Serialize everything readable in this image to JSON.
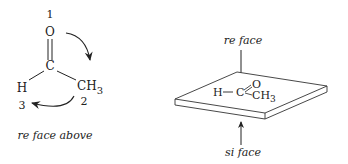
{
  "left_panel": {
    "molecule": {
      "oxygen": "O",
      "carbon": "C",
      "hydrogen": "H",
      "methyl": "CH",
      "methyl_sub": "3"
    },
    "priorities": {
      "oxygen": "1",
      "methyl": "2",
      "hydrogen": "3"
    },
    "caption": "re face above"
  },
  "right_panel": {
    "top_label": "re face",
    "bottom_label": "si face",
    "molecule": {
      "hydrogen": "H",
      "bond": "−",
      "carbon": "C",
      "oxygen": "O",
      "methyl": "CH",
      "methyl_sub": "3"
    }
  },
  "colors": {
    "ink": "#222222",
    "background": "#ffffff"
  }
}
